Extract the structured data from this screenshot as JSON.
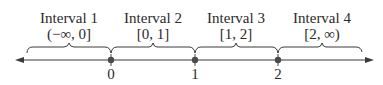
{
  "intervals": [
    {
      "title": "Interval 1",
      "notation": "(−∞, 0]"
    },
    {
      "title": "Interval 2",
      "notation": "[0, 1]"
    },
    {
      "title": "Interval 3",
      "notation": "[1, 2]"
    },
    {
      "title": "Interval 4",
      "notation": "[2, ∞)"
    }
  ],
  "points": [
    {
      "label": "0"
    },
    {
      "label": "1"
    },
    {
      "label": "2"
    }
  ],
  "colors": {
    "line": "#3a3a3a",
    "dot": "#4a4a4a",
    "text": "#2a2a2a"
  }
}
